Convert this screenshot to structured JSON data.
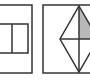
{
  "diagram": {
    "colors": {
      "background": "#ffffff",
      "stroke": "#333333",
      "shade": "#b8b8b8"
    },
    "panels": [
      {
        "id": "left",
        "frame": {
          "x": -14,
          "y": 5,
          "w": 46,
          "h": 68
        },
        "shapes": [
          {
            "type": "rect",
            "x": -10,
            "y": 24,
            "w": 38,
            "h": 29
          },
          {
            "type": "line",
            "x1": 12,
            "y1": 24,
            "x2": 12,
            "y2": 53
          }
        ]
      },
      {
        "id": "right",
        "frame": {
          "x": 43,
          "y": 5,
          "w": 70,
          "h": 68
        },
        "shapes": [
          {
            "type": "rhombus",
            "top": [
              79,
              6
            ],
            "right": [
              98,
              39
            ],
            "bottom": [
              79,
              72
            ],
            "left": [
              60,
              39
            ]
          },
          {
            "type": "line",
            "x1": 60,
            "y1": 39,
            "x2": 98,
            "y2": 39
          },
          {
            "type": "line",
            "x1": 79,
            "y1": 6,
            "x2": 79,
            "y2": 72
          },
          {
            "type": "shaded-triangle",
            "points": [
              [
                79,
                6
              ],
              [
                98,
                39
              ],
              [
                79,
                39
              ]
            ]
          }
        ]
      }
    ]
  }
}
